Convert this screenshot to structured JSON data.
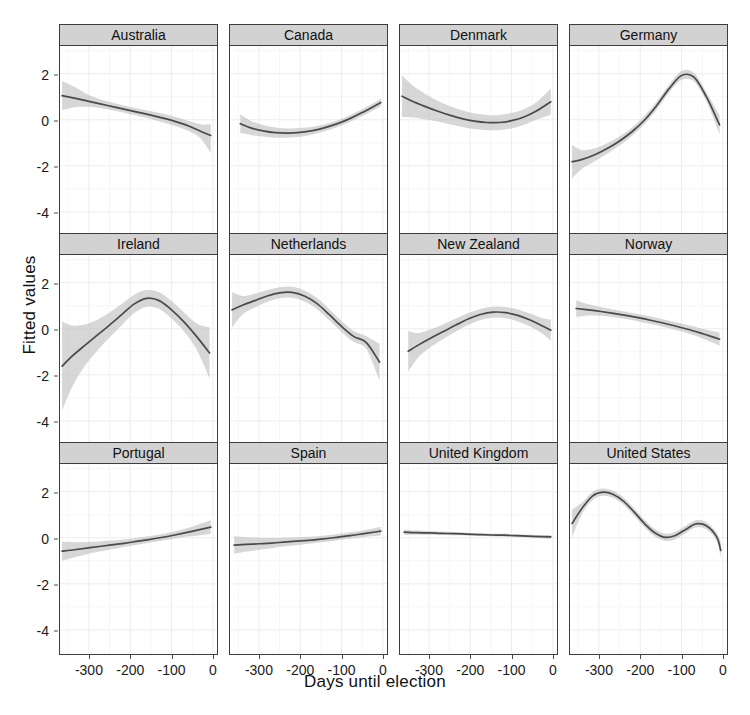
{
  "chart_data": {
    "type": "line",
    "title": "",
    "xlabel": "Days until election",
    "ylabel": "Fitted values",
    "xlim": [
      -370,
      10
    ],
    "ylim": [
      -5.0,
      3.2
    ],
    "xticks": [
      -300,
      -200,
      -100,
      0
    ],
    "xtick_labels": [
      "-300",
      "-200",
      "-100",
      "0"
    ],
    "yticks": [
      2,
      0,
      -2,
      -4
    ],
    "ytick_labels": [
      "2",
      "0",
      "-2",
      "-4"
    ],
    "grid": true,
    "legend": "none",
    "facet_rows": 3,
    "facet_cols": 4,
    "band_description": "shaded 95% confidence ribbon around each fitted smooth line",
    "colors": {
      "line": "#4a4a4a",
      "ribbon": "#bfbfbf",
      "strip_background": "#d2d2d2",
      "panel_background": "#ffffff",
      "panel_border": "#3d3d3d",
      "gridline": "#ececf2"
    },
    "panels": [
      {
        "name": "Australia",
        "x": [
          -365,
          -330,
          -300,
          -270,
          -240,
          -210,
          -180,
          -150,
          -120,
          -90,
          -60,
          -30,
          -5
        ],
        "fit": [
          1.05,
          0.92,
          0.8,
          0.68,
          0.56,
          0.44,
          0.32,
          0.2,
          0.07,
          -0.08,
          -0.26,
          -0.5,
          -0.68
        ],
        "lower": [
          0.42,
          0.55,
          0.56,
          0.5,
          0.4,
          0.28,
          0.16,
          0.03,
          -0.12,
          -0.28,
          -0.48,
          -0.8,
          -1.45
        ],
        "upper": [
          1.68,
          1.38,
          1.07,
          0.88,
          0.73,
          0.6,
          0.48,
          0.37,
          0.26,
          0.12,
          -0.04,
          -0.2,
          -0.2
        ]
      },
      {
        "name": "Canada",
        "x": [
          -345,
          -320,
          -290,
          -260,
          -230,
          -200,
          -170,
          -140,
          -110,
          -80,
          -50,
          -20,
          -5
        ],
        "fit": [
          -0.17,
          -0.35,
          -0.48,
          -0.56,
          -0.58,
          -0.55,
          -0.47,
          -0.34,
          -0.17,
          0.05,
          0.31,
          0.6,
          0.75
        ],
        "lower": [
          -0.58,
          -0.66,
          -0.73,
          -0.78,
          -0.78,
          -0.74,
          -0.64,
          -0.49,
          -0.31,
          -0.1,
          0.16,
          0.45,
          0.58
        ],
        "upper": [
          0.24,
          -0.04,
          -0.23,
          -0.34,
          -0.38,
          -0.36,
          -0.3,
          -0.19,
          -0.03,
          0.2,
          0.46,
          0.75,
          0.92
        ]
      },
      {
        "name": "Denmark",
        "x": [
          -365,
          -340,
          -310,
          -280,
          -250,
          -220,
          -190,
          -160,
          -130,
          -100,
          -70,
          -40,
          -5
        ],
        "fit": [
          1.02,
          0.8,
          0.58,
          0.38,
          0.2,
          0.05,
          -0.06,
          -0.12,
          -0.12,
          -0.04,
          0.12,
          0.38,
          0.78
        ],
        "lower": [
          0.12,
          0.1,
          0.02,
          -0.08,
          -0.2,
          -0.31,
          -0.4,
          -0.45,
          -0.45,
          -0.38,
          -0.22,
          0.0,
          0.22
        ],
        "upper": [
          1.92,
          1.5,
          1.14,
          0.84,
          0.6,
          0.41,
          0.28,
          0.21,
          0.21,
          0.3,
          0.46,
          0.76,
          1.34
        ]
      },
      {
        "name": "Germany",
        "x": [
          -365,
          -340,
          -310,
          -280,
          -250,
          -220,
          -190,
          -160,
          -130,
          -100,
          -70,
          -40,
          -8
        ],
        "fit": [
          -1.82,
          -1.72,
          -1.52,
          -1.25,
          -0.92,
          -0.52,
          -0.02,
          0.62,
          1.35,
          1.92,
          1.85,
          1.0,
          -0.22
        ],
        "lower": [
          -2.55,
          -2.12,
          -1.8,
          -1.48,
          -1.12,
          -0.7,
          -0.2,
          0.44,
          1.18,
          1.72,
          1.66,
          0.8,
          -0.62
        ],
        "upper": [
          -1.09,
          -1.32,
          -1.24,
          -1.02,
          -0.72,
          -0.34,
          0.16,
          0.8,
          1.52,
          2.12,
          2.04,
          1.2,
          0.18
        ]
      },
      {
        "name": "Ireland",
        "x": [
          -365,
          -340,
          -310,
          -280,
          -250,
          -220,
          -190,
          -160,
          -130,
          -100,
          -70,
          -40,
          -8
        ],
        "fit": [
          -1.62,
          -1.18,
          -0.72,
          -0.28,
          0.16,
          0.62,
          1.08,
          1.32,
          1.22,
          0.82,
          0.3,
          -0.32,
          -1.05
        ],
        "lower": [
          -3.55,
          -2.5,
          -1.62,
          -0.95,
          -0.38,
          0.16,
          0.68,
          0.96,
          0.86,
          0.44,
          -0.12,
          -0.88,
          -2.15
        ],
        "upper": [
          0.31,
          0.14,
          0.18,
          0.39,
          0.7,
          1.08,
          1.48,
          1.68,
          1.58,
          1.2,
          0.72,
          0.24,
          0.05
        ]
      },
      {
        "name": "Netherlands",
        "x": [
          -365,
          -340,
          -310,
          -280,
          -250,
          -220,
          -190,
          -160,
          -130,
          -100,
          -70,
          -40,
          -8
        ],
        "fit": [
          0.82,
          1.02,
          1.22,
          1.42,
          1.56,
          1.58,
          1.42,
          1.1,
          0.62,
          0.1,
          -0.34,
          -0.6,
          -1.45
        ],
        "lower": [
          0.05,
          0.62,
          0.92,
          1.16,
          1.32,
          1.34,
          1.18,
          0.86,
          0.38,
          -0.14,
          -0.58,
          -0.88,
          -2.25
        ],
        "upper": [
          1.59,
          1.42,
          1.52,
          1.68,
          1.8,
          1.82,
          1.66,
          1.34,
          0.86,
          0.34,
          -0.1,
          -0.32,
          -0.65
        ]
      },
      {
        "name": "New Zealand",
        "x": [
          -350,
          -325,
          -295,
          -265,
          -235,
          -205,
          -175,
          -145,
          -115,
          -85,
          -55,
          -25,
          -5
        ],
        "fit": [
          -0.98,
          -0.7,
          -0.4,
          -0.12,
          0.16,
          0.42,
          0.62,
          0.72,
          0.7,
          0.58,
          0.38,
          0.12,
          -0.06
        ],
        "lower": [
          -1.85,
          -1.22,
          -0.78,
          -0.44,
          -0.12,
          0.16,
          0.38,
          0.48,
          0.46,
          0.32,
          0.1,
          -0.22,
          -0.52
        ],
        "upper": [
          -0.11,
          -0.18,
          -0.02,
          0.2,
          0.44,
          0.68,
          0.86,
          0.96,
          0.94,
          0.84,
          0.66,
          0.46,
          0.4
        ]
      },
      {
        "name": "Norway",
        "x": [
          -355,
          -325,
          -295,
          -265,
          -235,
          -205,
          -175,
          -145,
          -115,
          -85,
          -55,
          -25,
          -8
        ],
        "fit": [
          0.88,
          0.82,
          0.75,
          0.67,
          0.58,
          0.48,
          0.37,
          0.25,
          0.12,
          -0.02,
          -0.18,
          -0.35,
          -0.45
        ],
        "lower": [
          0.52,
          0.58,
          0.56,
          0.5,
          0.42,
          0.32,
          0.21,
          0.09,
          -0.04,
          -0.2,
          -0.38,
          -0.6,
          -0.74
        ],
        "upper": [
          1.24,
          1.06,
          0.94,
          0.84,
          0.74,
          0.64,
          0.53,
          0.41,
          0.28,
          0.16,
          0.02,
          -0.1,
          -0.16
        ]
      },
      {
        "name": "Portugal",
        "x": [
          -365,
          -335,
          -305,
          -275,
          -245,
          -215,
          -185,
          -155,
          -125,
          -95,
          -65,
          -35,
          -5
        ],
        "fit": [
          -0.58,
          -0.52,
          -0.45,
          -0.38,
          -0.31,
          -0.24,
          -0.16,
          -0.08,
          0.01,
          0.11,
          0.22,
          0.34,
          0.46
        ],
        "lower": [
          -1.0,
          -0.85,
          -0.72,
          -0.6,
          -0.5,
          -0.4,
          -0.31,
          -0.22,
          -0.13,
          -0.04,
          0.04,
          0.1,
          0.16
        ],
        "upper": [
          -0.16,
          -0.19,
          -0.18,
          -0.16,
          -0.12,
          -0.08,
          -0.01,
          0.06,
          0.15,
          0.26,
          0.4,
          0.58,
          0.76
        ]
      },
      {
        "name": "Spain",
        "x": [
          -360,
          -330,
          -300,
          -270,
          -240,
          -210,
          -180,
          -150,
          -120,
          -90,
          -60,
          -30,
          -5
        ],
        "fit": [
          -0.32,
          -0.29,
          -0.26,
          -0.23,
          -0.19,
          -0.15,
          -0.11,
          -0.06,
          0.0,
          0.07,
          0.14,
          0.22,
          0.29
        ],
        "lower": [
          -0.7,
          -0.6,
          -0.52,
          -0.45,
          -0.38,
          -0.32,
          -0.26,
          -0.2,
          -0.14,
          -0.07,
          0.0,
          0.06,
          0.1
        ],
        "upper": [
          0.06,
          0.02,
          0.0,
          -0.01,
          0.0,
          0.02,
          0.04,
          0.08,
          0.14,
          0.21,
          0.28,
          0.38,
          0.48
        ]
      },
      {
        "name": "United Kingdom",
        "x": [
          -360,
          -330,
          -300,
          -270,
          -240,
          -210,
          -180,
          -150,
          -120,
          -90,
          -60,
          -30,
          -5
        ],
        "fit": [
          0.24,
          0.22,
          0.21,
          0.19,
          0.18,
          0.16,
          0.14,
          0.12,
          0.11,
          0.09,
          0.07,
          0.05,
          0.04
        ],
        "lower": [
          0.12,
          0.13,
          0.13,
          0.12,
          0.11,
          0.1,
          0.09,
          0.07,
          0.05,
          0.03,
          0.01,
          -0.02,
          -0.04
        ],
        "upper": [
          0.36,
          0.31,
          0.29,
          0.26,
          0.25,
          0.22,
          0.19,
          0.17,
          0.17,
          0.15,
          0.13,
          0.12,
          0.12
        ]
      },
      {
        "name": "United States",
        "x": [
          -365,
          -340,
          -315,
          -290,
          -265,
          -240,
          -215,
          -190,
          -165,
          -140,
          -115,
          -90,
          -65,
          -40,
          -15,
          -5
        ],
        "fit": [
          0.62,
          1.3,
          1.82,
          1.98,
          1.88,
          1.58,
          1.12,
          0.62,
          0.22,
          0.02,
          0.1,
          0.36,
          0.6,
          0.52,
          0.04,
          -0.55
        ],
        "lower": [
          0.02,
          1.06,
          1.64,
          1.82,
          1.72,
          1.42,
          0.96,
          0.46,
          0.06,
          -0.14,
          -0.06,
          0.2,
          0.44,
          0.36,
          -0.14,
          -0.92
        ],
        "upper": [
          1.22,
          1.54,
          2.0,
          2.14,
          2.04,
          1.74,
          1.28,
          0.78,
          0.38,
          0.18,
          0.26,
          0.52,
          0.76,
          0.68,
          0.22,
          -0.18
        ]
      }
    ]
  }
}
